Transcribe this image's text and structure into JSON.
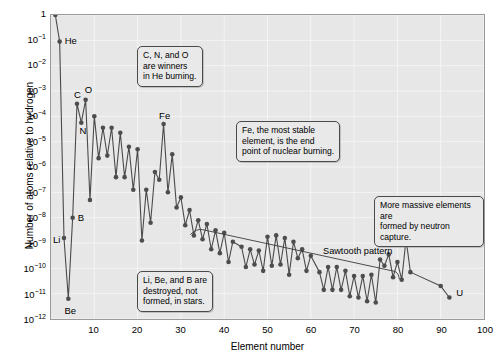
{
  "chart_data": {
    "type": "line",
    "title": "",
    "xlabel": "Element number",
    "ylabel": "Number of atoms relative to hydrogen",
    "xlim": [
      0,
      100
    ],
    "ylim_log10": [
      -12,
      0
    ],
    "yscale": "log",
    "grid": true,
    "legend": "none",
    "xticks": [
      10,
      20,
      30,
      40,
      50,
      60,
      70,
      80,
      90,
      100
    ],
    "ytick_labels": [
      "1",
      "10⁻¹",
      "10⁻²",
      "10⁻³",
      "10⁻⁴",
      "10⁻⁵",
      "10⁻⁶",
      "10⁻⁷",
      "10⁻⁸",
      "10⁻⁹",
      "10⁻¹⁰",
      "10⁻¹¹",
      "10⁻¹²"
    ],
    "ytick_exponents": [
      0,
      -1,
      -2,
      -3,
      -4,
      -5,
      -6,
      -7,
      -8,
      -9,
      -10,
      -11,
      -12
    ],
    "marker_color": "#4d4d4d",
    "line_color": "#4a4a4a",
    "plot_background": "#e7e7e7",
    "gridline_color": "#f4f4f4",
    "series": [
      {
        "name": "Solar system abundance",
        "x": [
          1,
          2,
          3,
          4,
          5,
          6,
          7,
          8,
          9,
          10,
          11,
          12,
          13,
          14,
          15,
          16,
          17,
          18,
          19,
          20,
          21,
          22,
          23,
          24,
          25,
          26,
          27,
          28,
          29,
          30,
          31,
          32,
          33,
          34,
          35,
          36,
          37,
          38,
          39,
          40,
          41,
          42,
          44,
          45,
          46,
          47,
          48,
          49,
          50,
          51,
          52,
          53,
          54,
          55,
          56,
          57,
          58,
          59,
          60,
          62,
          63,
          64,
          65,
          66,
          67,
          68,
          69,
          70,
          71,
          72,
          73,
          74,
          75,
          76,
          77,
          78,
          79,
          80,
          81,
          82,
          83,
          90,
          92
        ],
        "y_log10": [
          0,
          -1.05,
          -8.8,
          -11.2,
          -8.0,
          -3.5,
          -4.25,
          -3.35,
          -7.3,
          -4.0,
          -5.65,
          -4.45,
          -5.55,
          -4.45,
          -6.4,
          -4.65,
          -6.4,
          -5.2,
          -6.9,
          -5.3,
          -8.9,
          -6.9,
          -8.2,
          -6.2,
          -6.5,
          -4.3,
          -7.0,
          -5.5,
          -7.6,
          -7.2,
          -8.3,
          -7.7,
          -8.7,
          -8.1,
          -8.85,
          -8.25,
          -9.25,
          -8.5,
          -9.4,
          -8.6,
          -9.75,
          -8.95,
          -9.15,
          -9.95,
          -9.25,
          -9.85,
          -9.3,
          -10.1,
          -8.75,
          -9.9,
          -8.7,
          -9.85,
          -8.8,
          -10.25,
          -8.95,
          -9.6,
          -9.25,
          -10.1,
          -9.5,
          -10.15,
          -10.85,
          -9.95,
          -10.85,
          -9.95,
          -10.85,
          -10.1,
          -11.1,
          -10.3,
          -11.15,
          -10.3,
          -11.3,
          -10.25,
          -11.35,
          -9.65,
          -9.9,
          -9.45,
          -10.35,
          -9.75,
          -10.45,
          -8.85,
          -10.15,
          -10.7,
          -11.15
        ]
      }
    ],
    "point_labels": [
      {
        "text": "H",
        "element": 1,
        "y_log10": 0
      },
      {
        "text": "He",
        "element": 2,
        "y_log10": -1.05
      },
      {
        "text": "Li",
        "element": 3,
        "y_log10": -8.8
      },
      {
        "text": "Be",
        "element": 4,
        "y_log10": -11.2
      },
      {
        "text": "B",
        "element": 5,
        "y_log10": -8.0
      },
      {
        "text": "C",
        "element": 6,
        "y_log10": -3.5
      },
      {
        "text": "N",
        "element": 7,
        "y_log10": -4.25
      },
      {
        "text": "O",
        "element": 8,
        "y_log10": -3.35
      },
      {
        "text": "Fe",
        "element": 26,
        "y_log10": -4.3
      },
      {
        "text": "U",
        "element": 92,
        "y_log10": -11.15
      }
    ],
    "annotations": [
      {
        "name": "cno-winners",
        "text": "C, N, and O\nare winners\nin He burning."
      },
      {
        "name": "fe-most-stable",
        "text": "Fe, the most stable\nelement, is the end\npoint of nuclear burning."
      },
      {
        "name": "neutron-capture",
        "text": "More massive elements are\nformed by neutron capture."
      },
      {
        "name": "li-be-b-destroyed",
        "text": "Li, Be, and B are\ndestroyed, not\nformed, in stars."
      },
      {
        "name": "sawtooth-pattern",
        "text": "Sawtooth pattern"
      }
    ]
  }
}
